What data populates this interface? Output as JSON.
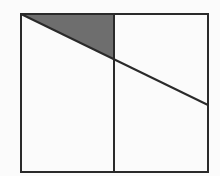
{
  "diagram": {
    "type": "geometry",
    "background": "#fbfbfb",
    "stroke_color": "#2a2a2a",
    "shade_color": "#6e6e6e",
    "rectangle": {
      "x1": 21,
      "y1": 14,
      "x2": 208,
      "y2": 172
    },
    "vertical_divider": {
      "x": 114,
      "y1": 14,
      "y2": 172
    },
    "diagonal": {
      "x1": 21,
      "y1": 14,
      "x2": 208,
      "y2": 105
    },
    "shaded_triangle": {
      "points": [
        [
          21,
          14
        ],
        [
          114,
          14
        ],
        [
          114,
          59
        ]
      ]
    }
  }
}
